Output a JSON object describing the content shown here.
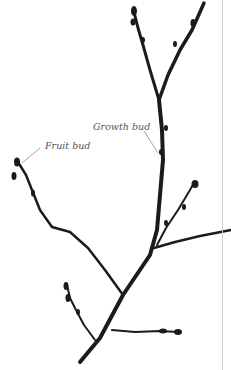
{
  "figure": {
    "labels": {
      "growth_bud": "Growth bud",
      "fruit_bud": "Fruit bud"
    },
    "colors": {
      "branch": "#1e1a1c",
      "leader": "#777777",
      "text": "#555555",
      "rule": "#cfcfcf"
    }
  }
}
